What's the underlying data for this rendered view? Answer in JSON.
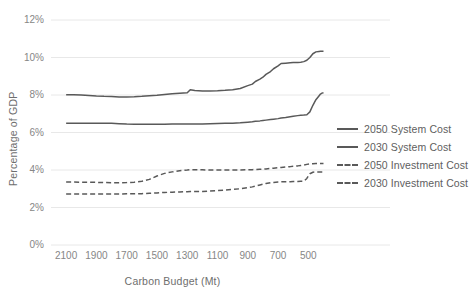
{
  "chart_data": {
    "type": "line",
    "title": "",
    "xlabel": "Carbon Budget (Mt)",
    "ylabel": "Percentage of GDP",
    "xlim": [
      2200,
      390
    ],
    "ylim": [
      0,
      12
    ],
    "x_reversed": true,
    "grid": "horizontal",
    "legend_position": "right",
    "x_ticks": [
      "2100",
      "1900",
      "1700",
      "1500",
      "1300",
      "1100",
      "900",
      "700",
      "500"
    ],
    "x_tick_values": [
      2100,
      1900,
      1700,
      1500,
      1300,
      1100,
      900,
      700,
      500
    ],
    "y_ticks": [
      "0%",
      "2%",
      "4%",
      "6%",
      "8%",
      "10%",
      "12%"
    ],
    "y_tick_values": [
      0,
      2,
      4,
      6,
      8,
      10,
      12
    ],
    "x": [
      2100,
      2050,
      2000,
      1950,
      1900,
      1850,
      1800,
      1750,
      1700,
      1650,
      1600,
      1550,
      1500,
      1450,
      1400,
      1350,
      1300,
      1280,
      1250,
      1200,
      1150,
      1100,
      1050,
      1000,
      950,
      900,
      870,
      850,
      820,
      800,
      780,
      750,
      730,
      700,
      680,
      650,
      620,
      600,
      570,
      550,
      530,
      510,
      490,
      470,
      450,
      430,
      420,
      410,
      400
    ],
    "series": [
      {
        "name": "2050 System Cost",
        "style": "solid",
        "color": "#595959",
        "values": [
          8.02,
          8.01,
          8.0,
          7.98,
          7.95,
          7.93,
          7.92,
          7.9,
          7.9,
          7.91,
          7.93,
          7.96,
          7.99,
          8.03,
          8.07,
          8.1,
          8.12,
          8.28,
          8.24,
          8.22,
          8.22,
          8.23,
          8.25,
          8.28,
          8.35,
          8.5,
          8.58,
          8.72,
          8.85,
          8.95,
          9.1,
          9.25,
          9.4,
          9.55,
          9.68,
          9.7,
          9.72,
          9.73,
          9.74,
          9.75,
          9.78,
          9.85,
          10.0,
          10.2,
          10.3,
          10.32,
          10.33,
          10.33,
          10.33
        ]
      },
      {
        "name": "2030 System Cost",
        "style": "solid",
        "color": "#595959",
        "values": [
          6.5,
          6.5,
          6.5,
          6.5,
          6.5,
          6.5,
          6.49,
          6.47,
          6.45,
          6.44,
          6.44,
          6.44,
          6.44,
          6.44,
          6.45,
          6.45,
          6.45,
          6.45,
          6.45,
          6.46,
          6.47,
          6.48,
          6.49,
          6.5,
          6.52,
          6.55,
          6.57,
          6.6,
          6.62,
          6.64,
          6.66,
          6.69,
          6.71,
          6.74,
          6.77,
          6.8,
          6.84,
          6.87,
          6.9,
          6.92,
          6.93,
          6.95,
          7.1,
          7.45,
          7.75,
          7.95,
          8.05,
          8.1,
          8.12
        ]
      },
      {
        "name": "2050 Investment Cost",
        "style": "dashed",
        "color": "#595959",
        "values": [
          3.36,
          3.36,
          3.35,
          3.35,
          3.34,
          3.33,
          3.32,
          3.32,
          3.33,
          3.35,
          3.4,
          3.5,
          3.68,
          3.82,
          3.9,
          3.96,
          4.0,
          4.02,
          4.02,
          4.01,
          4.0,
          4.0,
          4.0,
          4.0,
          4.0,
          4.01,
          4.02,
          4.03,
          4.04,
          4.05,
          4.06,
          4.08,
          4.1,
          4.12,
          4.14,
          4.16,
          4.18,
          4.2,
          4.22,
          4.24,
          4.26,
          4.3,
          4.33,
          4.34,
          4.35,
          4.35,
          4.35,
          4.35,
          4.35
        ]
      },
      {
        "name": "2030 Investment Cost",
        "style": "dashed",
        "color": "#595959",
        "values": [
          2.72,
          2.72,
          2.72,
          2.72,
          2.72,
          2.72,
          2.72,
          2.72,
          2.73,
          2.73,
          2.74,
          2.76,
          2.78,
          2.8,
          2.82,
          2.83,
          2.84,
          2.85,
          2.85,
          2.86,
          2.88,
          2.9,
          2.93,
          2.96,
          3.0,
          3.06,
          3.1,
          3.14,
          3.2,
          3.24,
          3.28,
          3.32,
          3.34,
          3.36,
          3.37,
          3.38,
          3.38,
          3.39,
          3.39,
          3.4,
          3.4,
          3.55,
          3.8,
          3.88,
          3.9,
          3.9,
          3.9,
          3.9,
          3.9
        ]
      }
    ]
  },
  "legend": {
    "items": [
      {
        "label": "2050 System Cost"
      },
      {
        "label": "2030 System Cost"
      },
      {
        "label": "2050 Investment Cost"
      },
      {
        "label": "2030 Investment Cost"
      }
    ]
  },
  "colors": {
    "line": "#595959",
    "gridline": "#e8e8e8",
    "tick_text": "#868686",
    "title_text": "#6e6e6e",
    "background": "#ffffff"
  }
}
